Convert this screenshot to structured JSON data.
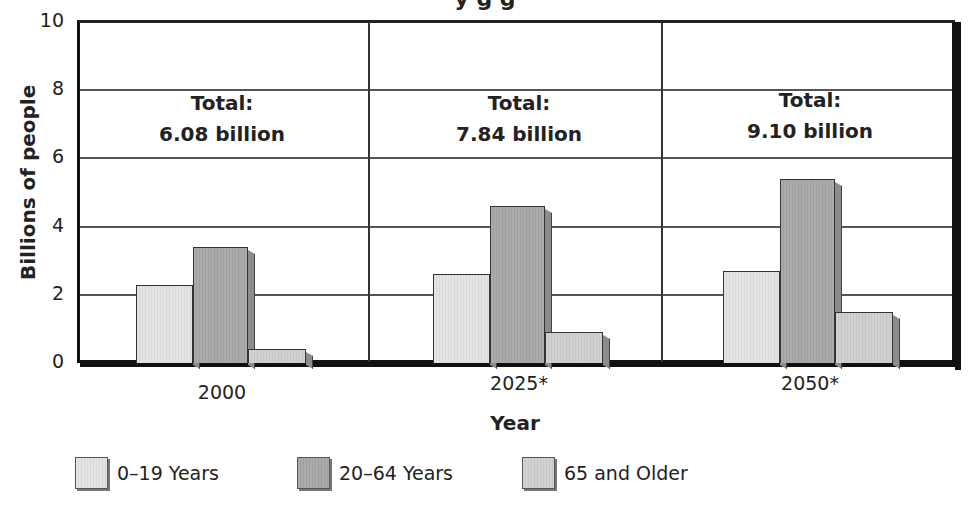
{
  "chart_data": {
    "type": "bar",
    "xlabel": "Year",
    "ylabel": "Billions of people",
    "ylim": [
      0,
      10
    ],
    "yticks": [
      "0",
      "2",
      "4",
      "6",
      "8",
      "10"
    ],
    "grid": true,
    "legend_position": "bottom",
    "categories": [
      "2000",
      "2025*",
      "2050*"
    ],
    "series": [
      {
        "name": "0–19 Years",
        "values": [
          2.3,
          2.6,
          2.7
        ],
        "color": "#e0e0e0"
      },
      {
        "name": "20–64 Years",
        "values": [
          3.4,
          4.6,
          5.4
        ],
        "color": "#a6a6a6"
      },
      {
        "name": "65 and Older",
        "values": [
          0.4,
          0.9,
          1.5
        ],
        "color": "#cccccc"
      }
    ],
    "annotations": [
      {
        "category": "2000",
        "line1": "Total:",
        "line2": "6.08 billion"
      },
      {
        "category": "2025*",
        "line1": "Total:",
        "line2": "7.84 billion"
      },
      {
        "category": "2050*",
        "line1": "Total:",
        "line2": "9.10 billion"
      }
    ]
  },
  "ui": {
    "title_fragment": "y              g  g"
  }
}
